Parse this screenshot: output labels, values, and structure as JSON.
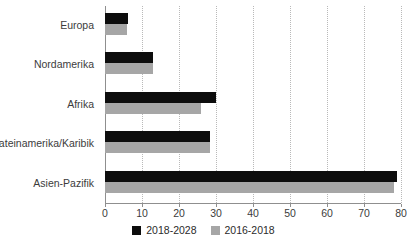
{
  "chart_data": {
    "type": "bar",
    "orientation": "horizontal",
    "title": "",
    "xlabel": "",
    "ylabel": "",
    "categories": [
      "Europa",
      "Nordamerika",
      "Afrika",
      "Lateinamerika/Karibik",
      "Asien-Pazifik"
    ],
    "series": [
      {
        "name": "2018-2028",
        "color": "#0d0d0d",
        "values": [
          6.3,
          13,
          30,
          28.5,
          79
        ]
      },
      {
        "name": "2016-2018",
        "color": "#a6a6a6",
        "values": [
          6,
          13,
          26,
          28.5,
          78
        ]
      }
    ],
    "xlim": [
      0,
      80
    ],
    "xticks": [
      0,
      10,
      20,
      30,
      40,
      50,
      60,
      70,
      80
    ],
    "xtick_labels": [
      "0",
      "10",
      "20",
      "30",
      "40",
      "50",
      "60",
      "70",
      "80"
    ],
    "grid": true,
    "grid_axis": "x",
    "grid_style": "dotted",
    "legend_position": "bottom"
  }
}
